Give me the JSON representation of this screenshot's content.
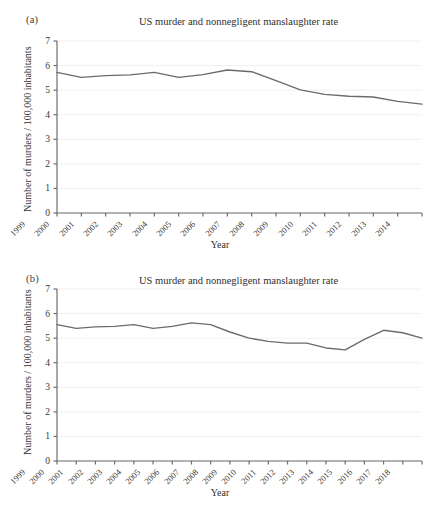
{
  "figure": {
    "panels": [
      {
        "tag": "(a)",
        "title": "US murder and nonnegligent manslaughter rate",
        "xlabel": "Year",
        "ylabel": "Number of murders / 100,000 inhabitants"
      },
      {
        "tag": "(b)",
        "title": "US murder and nonnegligent manslaughter rate",
        "xlabel": "Year",
        "ylabel": "Number of murders / 100,000 inhabitants"
      }
    ],
    "colors": {
      "line": "#6b6b6b",
      "axis": "#6e6e6e",
      "grid": "#f0f0f2",
      "text": "#3a3a3a",
      "background": "#ffffff"
    }
  },
  "chart_data": [
    {
      "type": "line",
      "title": "US murder and nonnegligent manslaughter rate",
      "xlabel": "Year",
      "ylabel": "Number of murders / 100,000 inhabitants",
      "panel": "(a)",
      "categories": [
        "1999",
        "2000",
        "2001",
        "2002",
        "2003",
        "2004",
        "2005",
        "2006",
        "2007",
        "2008",
        "2009",
        "2010",
        "2011",
        "2012",
        "2013",
        "2014"
      ],
      "values": [
        5.72,
        5.52,
        5.59,
        5.62,
        5.72,
        5.52,
        5.63,
        5.82,
        5.75,
        5.39,
        5.01,
        4.83,
        4.75,
        4.72,
        4.54,
        4.43
      ],
      "ylim": [
        0,
        7
      ],
      "yticks": [
        0,
        1,
        2,
        3,
        4,
        5,
        6,
        7
      ],
      "grid": true,
      "legend": "none"
    },
    {
      "type": "line",
      "title": "US murder and nonnegligent manslaughter rate",
      "xlabel": "Year",
      "ylabel": "Number of murders / 100,000 inhabitants",
      "panel": "(b)",
      "categories": [
        "1999",
        "2000",
        "2001",
        "2002",
        "2003",
        "2004",
        "2005",
        "2006",
        "2007",
        "2008",
        "2009",
        "2010",
        "2011",
        "2012",
        "2013",
        "2014",
        "2015",
        "2016",
        "2017",
        "2018"
      ],
      "values": [
        5.55,
        5.4,
        5.46,
        5.48,
        5.55,
        5.4,
        5.48,
        5.62,
        5.55,
        5.25,
        5.0,
        4.87,
        4.8,
        4.8,
        4.6,
        4.52,
        4.95,
        5.32,
        5.22,
        5.0
      ],
      "ylim": [
        0,
        7
      ],
      "yticks": [
        0,
        1,
        2,
        3,
        4,
        5,
        6,
        7
      ],
      "grid": true,
      "legend": "none"
    }
  ]
}
